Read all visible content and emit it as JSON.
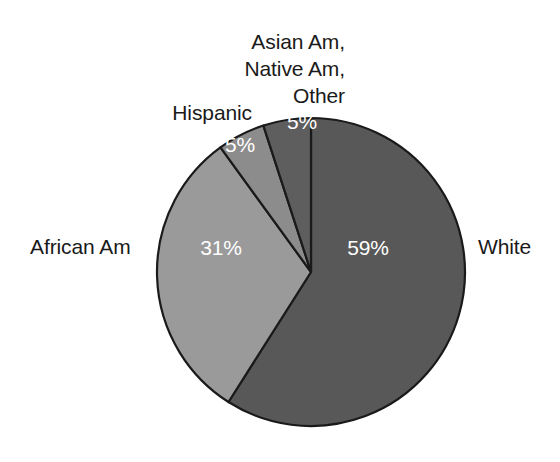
{
  "chart_data": {
    "type": "pie",
    "title": "",
    "subtitle": "",
    "xlabel": "",
    "ylabel": "",
    "grid": false,
    "legend_position": "outside-labels",
    "units": "percent",
    "start_angle_deg": 0,
    "direction": "clockwise",
    "categories": [
      "White",
      "African Am",
      "Hispanic",
      "Asian Am, Native Am, Other"
    ],
    "values": [
      59,
      31,
      5,
      5
    ],
    "slices": [
      {
        "label": "White",
        "value": 59,
        "value_label": "59%",
        "color": "#585858",
        "start_deg": 0,
        "end_deg": 212.4
      },
      {
        "label": "African Am",
        "value": 31,
        "value_label": "31%",
        "color": "#9a9a9a",
        "start_deg": 212.4,
        "end_deg": 324.0
      },
      {
        "label": "Hispanic",
        "value": 5,
        "value_label": "5%",
        "color": "#8c8c8c",
        "start_deg": 324.0,
        "end_deg": 342.0
      },
      {
        "label": "Asian Am, Native Am, Other",
        "value": 5,
        "value_label": "5%",
        "color": "#5e5e5e",
        "start_deg": 342.0,
        "end_deg": 360.0
      }
    ]
  },
  "labels": {
    "asian_line1": "Asian Am,",
    "asian_line2": "Native Am,",
    "asian_line3": "Other",
    "hispanic": "Hispanic",
    "african_am": "African Am",
    "white": "White"
  },
  "values": {
    "white": "59%",
    "african_am": "31%",
    "hispanic": "5%",
    "asian_other": "5%"
  },
  "colors": {
    "background": "#ffffff",
    "outline": "#1a1a1a",
    "label_text": "#1a1a1a",
    "value_text": "#ffffff",
    "slice_white": "#585858",
    "slice_african_am": "#9a9a9a",
    "slice_hispanic": "#8c8c8c",
    "slice_asian_other": "#5e5e5e"
  },
  "geometry": {
    "center_x": 311,
    "center_y": 272,
    "radius": 154
  }
}
